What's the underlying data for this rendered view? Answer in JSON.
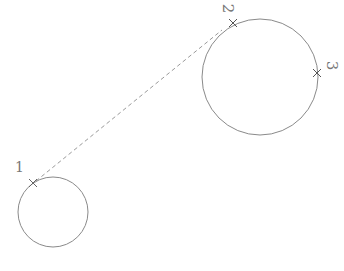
{
  "diagram": {
    "stroke_color": "#8a8a8a",
    "marker_color": "#555555",
    "circles": [
      {
        "id": "small",
        "cx": 53,
        "cy": 212,
        "r": 35
      },
      {
        "id": "large",
        "cx": 260,
        "cy": 77,
        "r": 58
      }
    ],
    "connector": {
      "style": "dashed",
      "x1": 36,
      "y1": 181,
      "x2": 222,
      "y2": 30
    },
    "points": [
      {
        "label": "1",
        "x": 33,
        "y": 183
      },
      {
        "label": "2",
        "x": 233,
        "y": 23
      },
      {
        "label": "3",
        "x": 317,
        "y": 73
      }
    ]
  }
}
